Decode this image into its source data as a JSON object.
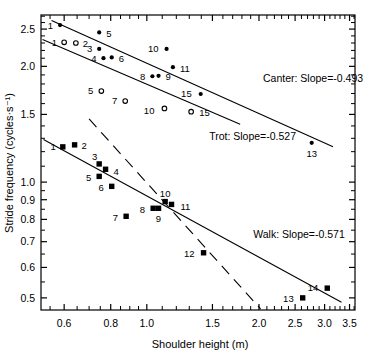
{
  "chart_data": {
    "type": "scatter",
    "title": "",
    "xlabel": "Shoulder height (m)",
    "ylabel": "Stride frequency (cycles·s⁻¹)",
    "xscale": "log",
    "yscale": "log",
    "xlim": [
      0.52,
      3.62
    ],
    "ylim": [
      0.465,
      2.72
    ],
    "grid": false,
    "legend_position": "inline-right",
    "xticks": [
      {
        "value": 0.6,
        "label": "0.6"
      },
      {
        "value": 0.8,
        "label": "0.8"
      },
      {
        "value": 1.0,
        "label": "1.0"
      },
      {
        "value": 1.5,
        "label": "1.5"
      },
      {
        "value": 2.0,
        "label": "2.0"
      },
      {
        "value": 2.5,
        "label": "2.5"
      },
      {
        "value": 3.0,
        "label": "3.0"
      },
      {
        "value": 3.5,
        "label": "3.5"
      }
    ],
    "xminor": [
      0.55,
      0.65,
      0.7,
      0.75,
      0.85,
      0.9,
      0.95,
      1.1,
      1.2,
      1.3,
      1.4,
      1.6,
      1.7,
      1.8,
      1.9,
      2.1,
      2.2,
      2.3,
      2.4,
      2.6,
      2.7,
      2.8,
      2.9,
      3.1,
      3.2,
      3.3,
      3.4,
      3.6
    ],
    "yticks": [
      {
        "value": 0.5,
        "label": "0.5"
      },
      {
        "value": 0.6,
        "label": "0.6"
      },
      {
        "value": 0.7,
        "label": "0.7"
      },
      {
        "value": 0.8,
        "label": "0.8"
      },
      {
        "value": 0.9,
        "label": "0.9"
      },
      {
        "value": 1.0,
        "label": "1.0"
      },
      {
        "value": 1.5,
        "label": "1.5"
      },
      {
        "value": 2.0,
        "label": "2.0"
      },
      {
        "value": 2.5,
        "label": "2.5"
      }
    ],
    "yminor": [
      0.55,
      0.65,
      0.75,
      0.85,
      0.95,
      1.1,
      1.2,
      1.3,
      1.4,
      1.6,
      1.7,
      1.8,
      1.9,
      2.1,
      2.2,
      2.3,
      2.4,
      2.6,
      2.7
    ],
    "series": [
      {
        "name": "Canter",
        "marker": "filled-circle",
        "slope": -0.493,
        "annotation": "Canter: Slope=-0.493",
        "annotation_x": 2.05,
        "annotation_y": 1.82,
        "fit_line": {
          "x1": 0.555,
          "y1": 2.63,
          "x2": 3.16,
          "y2": 1.235
        },
        "points": [
          {
            "label": "1",
            "x": 0.585,
            "y": 2.56,
            "label_dx": -7,
            "label_dy": 0
          },
          {
            "label": "5",
            "x": 0.745,
            "y": 2.45,
            "label_dx": 7,
            "label_dy": 1
          },
          {
            "label": "3",
            "x": 0.745,
            "y": 2.22,
            "label_dx": -7,
            "label_dy": 0
          },
          {
            "label": "4",
            "x": 0.765,
            "y": 2.1,
            "label_dx": -7,
            "label_dy": 0
          },
          {
            "label": "6",
            "x": 0.805,
            "y": 2.11,
            "label_dx": 7,
            "label_dy": 1
          },
          {
            "label": "10",
            "x": 1.13,
            "y": 2.22,
            "label_dx": -8,
            "label_dy": 0
          },
          {
            "label": "11",
            "x": 1.175,
            "y": 1.99,
            "label_dx": 7,
            "label_dy": 1
          },
          {
            "label": "8",
            "x": 1.035,
            "y": 1.885,
            "label_dx": -7,
            "label_dy": 0
          },
          {
            "label": "9",
            "x": 1.075,
            "y": 1.89,
            "label_dx": 7,
            "label_dy": 1
          },
          {
            "label": "15",
            "x": 1.395,
            "y": 1.695,
            "label_dx": -9,
            "label_dy": 0
          },
          {
            "label": "13",
            "x": 2.77,
            "y": 1.265,
            "label_dx": 0,
            "label_dy": 11
          }
        ]
      },
      {
        "name": "Trot",
        "marker": "open-circle",
        "slope": -0.527,
        "annotation": "Trot: Slope=-0.527",
        "annotation_x": 1.47,
        "annotation_y": 1.285,
        "fit_line": {
          "x1": 0.525,
          "y1": 2.35,
          "x2": 1.78,
          "y2": 1.415
        },
        "points": [
          {
            "label": "1",
            "x": 0.6,
            "y": 2.31,
            "label_dx": -7,
            "label_dy": 0
          },
          {
            "label": "2",
            "x": 0.645,
            "y": 2.3,
            "label_dx": 7,
            "label_dy": 1
          },
          {
            "label": "5",
            "x": 0.755,
            "y": 1.725,
            "label_dx": -8,
            "label_dy": 0
          },
          {
            "label": "7",
            "x": 0.875,
            "y": 1.625,
            "label_dx": -8,
            "label_dy": 0
          },
          {
            "label": "10",
            "x": 1.115,
            "y": 1.555,
            "label_dx": -10,
            "label_dy": 2
          },
          {
            "label": "15",
            "x": 1.315,
            "y": 1.525,
            "label_dx": 8,
            "label_dy": 1
          }
        ]
      },
      {
        "name": "Walk",
        "marker": "filled-square",
        "slope": -0.571,
        "annotation": "Walk: Slope=-0.571",
        "annotation_x": 1.93,
        "annotation_y": 0.715,
        "fit_line": {
          "x1": 0.528,
          "y1": 1.29,
          "x2": 3.33,
          "y2": 0.487
        },
        "points": [
          {
            "label": "1",
            "x": 0.595,
            "y": 1.235,
            "label_dx": -7,
            "label_dy": 0
          },
          {
            "label": "2",
            "x": 0.64,
            "y": 1.25,
            "label_dx": 7,
            "label_dy": 1
          },
          {
            "label": "3",
            "x": 0.745,
            "y": 1.115,
            "label_dx": -2,
            "label_dy": -7
          },
          {
            "label": "4",
            "x": 0.775,
            "y": 1.08,
            "label_dx": 8,
            "label_dy": 2
          },
          {
            "label": "5",
            "x": 0.745,
            "y": 1.035,
            "label_dx": -8,
            "label_dy": 1
          },
          {
            "label": "6",
            "x": 0.805,
            "y": 0.975,
            "label_dx": -8,
            "label_dy": 1
          },
          {
            "label": "7",
            "x": 0.88,
            "y": 0.815,
            "label_dx": -8,
            "label_dy": 1
          },
          {
            "label": "8",
            "x": 1.04,
            "y": 0.855,
            "label_dx": -8,
            "label_dy": 1
          },
          {
            "label": "9",
            "x": 1.075,
            "y": 0.855,
            "label_dx": 0,
            "label_dy": 10
          },
          {
            "label": "10",
            "x": 1.12,
            "y": 0.89,
            "label_dx": 0,
            "label_dy": -8
          },
          {
            "label": "11",
            "x": 1.165,
            "y": 0.875,
            "label_dx": 9,
            "label_dy": 2
          },
          {
            "label": "12",
            "x": 1.42,
            "y": 0.655,
            "label_dx": -9,
            "label_dy": 1
          },
          {
            "label": "13",
            "x": 2.62,
            "y": 0.5,
            "label_dx": -9,
            "label_dy": 1
          },
          {
            "label": "14",
            "x": 3.05,
            "y": 0.53,
            "label_dx": -9,
            "label_dy": -1
          }
        ]
      }
    ],
    "guide_line": {
      "name": "trot-walk-transition-guide",
      "style": "dashed",
      "x1": 0.7,
      "y1": 1.46,
      "x2": 2.02,
      "y2": 0.468
    }
  }
}
